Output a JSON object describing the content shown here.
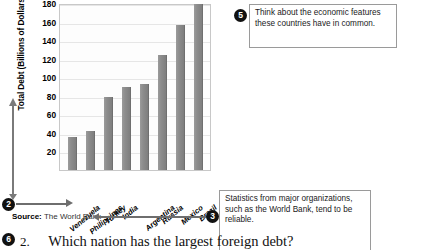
{
  "chart_data": {
    "type": "bar",
    "title": "",
    "xlabel": "",
    "ylabel": "Total Debt (Billions of Dollars)",
    "ylim": [
      0,
      180
    ],
    "grid": true,
    "legend": "none",
    "yticks": [
      180,
      160,
      140,
      120,
      100,
      80,
      60,
      40,
      20
    ],
    "categories": [
      "Venezuela",
      "Philippines",
      "Turkey",
      "India",
      "Argentina",
      "Russia",
      "Mexico",
      "Brazil"
    ],
    "values": [
      36,
      42,
      79,
      89,
      93,
      124,
      156,
      179
    ],
    "source_label": "Source:",
    "source_value": "The World Bank"
  },
  "callouts": [
    {
      "number": "2",
      "text": ""
    },
    {
      "number": "3",
      "text": "Statistics from major organizations, such as the World Bank, tend to be reliable."
    },
    {
      "number": "5",
      "text": "Think about the economic features these countries have in common."
    },
    {
      "number": "6",
      "text": ""
    }
  ],
  "question": {
    "number": "2.",
    "text": "Which nation has the largest foreign debt?"
  }
}
